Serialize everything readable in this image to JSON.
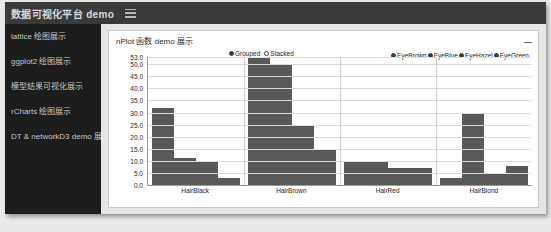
{
  "header": {
    "brand": "数据可视化平台 demo",
    "menu_icon": "hamburger-icon"
  },
  "sidebar": {
    "items": [
      {
        "label": "lattice 绘图展示"
      },
      {
        "label": "ggplot2 绘图展示"
      },
      {
        "label": "模型结果可视化展示"
      },
      {
        "label": "rCharts 绘图展示"
      },
      {
        "label": "DT & networkD3 demo 展示"
      }
    ]
  },
  "panel": {
    "title": "nPlot 函数 demo 展示",
    "collapse_icon": "minimize-icon"
  },
  "controls": {
    "options": [
      {
        "label": "Grouped",
        "selected": true
      },
      {
        "label": "Stacked",
        "selected": false
      }
    ]
  },
  "chart_data": {
    "type": "bar",
    "title": "",
    "xlabel": "",
    "ylabel": "",
    "grouping": "grouped",
    "categories": [
      "HairBlack",
      "HairBrown",
      "HairRed",
      "HairBlond"
    ],
    "series": [
      {
        "name": "EyeBrown",
        "values": [
          32,
          53,
          10,
          3
        ]
      },
      {
        "name": "EyeBlue",
        "values": [
          11,
          50,
          10,
          30
        ]
      },
      {
        "name": "EyeHazel",
        "values": [
          10,
          25,
          7,
          5
        ]
      },
      {
        "name": "EyeGreen",
        "values": [
          3,
          15,
          7,
          8
        ]
      }
    ],
    "ylim": [
      0,
      53
    ],
    "yticks": [
      "0.0",
      "5.0",
      "10.0",
      "15.0",
      "20.0",
      "25.0",
      "30.0",
      "35.0",
      "40.0",
      "45.0",
      "50.0",
      "53.0"
    ],
    "ytick_values": [
      0,
      5,
      10,
      15,
      20,
      25,
      30,
      35,
      40,
      45,
      50,
      53
    ],
    "grid": true,
    "legend_position": "top-right",
    "bar_color": "#595959"
  }
}
